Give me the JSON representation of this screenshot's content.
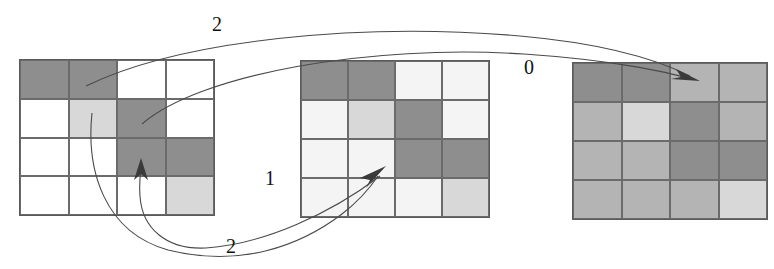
{
  "figure": {
    "kind": "grid-transition-diagram",
    "panel_count": 3,
    "grid_rows": 4,
    "grid_cols": 4
  },
  "palette": {
    "dark": "#8e8e8e",
    "light": "#d8d8d8",
    "empty_grid1": "#ffffff",
    "empty_grid2": "#f4f4f4",
    "empty_grid3": "#b4b4b4",
    "grid_line": "#6b6b6b",
    "outer_border": "#5a5a5a",
    "arrow_stroke": "#4a4a4a",
    "arrow_head": "#3a3a3a",
    "label_text": "#111111",
    "background": "#ffffff"
  },
  "grids": [
    {
      "name": "grid-1",
      "cells": [
        [
          "dark",
          "dark",
          "empty",
          "empty"
        ],
        [
          "empty",
          "light",
          "dark",
          "empty"
        ],
        [
          "empty",
          "empty",
          "dark",
          "dark"
        ],
        [
          "empty",
          "empty",
          "empty",
          "light"
        ]
      ]
    },
    {
      "name": "grid-2",
      "cells": [
        [
          "dark",
          "dark",
          "empty",
          "empty"
        ],
        [
          "empty",
          "light",
          "dark",
          "empty"
        ],
        [
          "empty",
          "empty",
          "dark",
          "dark"
        ],
        [
          "empty",
          "empty",
          "empty",
          "light"
        ]
      ]
    },
    {
      "name": "grid-3",
      "cells": [
        [
          "dark",
          "dark",
          "empty",
          "empty"
        ],
        [
          "empty",
          "light",
          "dark",
          "empty"
        ],
        [
          "empty",
          "empty",
          "dark",
          "dark"
        ],
        [
          "empty",
          "empty",
          "empty",
          "light"
        ]
      ]
    }
  ],
  "labels": {
    "top_arrow": "2",
    "right_arrow": "0",
    "middle_arrow": "1",
    "bottom_arrow": "2"
  }
}
